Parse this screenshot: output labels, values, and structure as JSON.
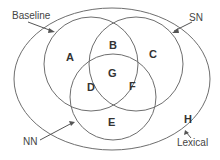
{
  "diagram": {
    "type": "venn",
    "colors": {
      "stroke": "#6e6e6e",
      "text": "#333333",
      "background": "#ffffff"
    },
    "sets": [
      {
        "id": "baseline",
        "label": "Baseline"
      },
      {
        "id": "sn",
        "label": "SN"
      },
      {
        "id": "nn",
        "label": "NN"
      },
      {
        "id": "lexical",
        "label": "Lexical"
      }
    ],
    "regions": [
      {
        "id": "A",
        "label": "A"
      },
      {
        "id": "B",
        "label": "B"
      },
      {
        "id": "C",
        "label": "C"
      },
      {
        "id": "D",
        "label": "D"
      },
      {
        "id": "E",
        "label": "E"
      },
      {
        "id": "F",
        "label": "F"
      },
      {
        "id": "G",
        "label": "G"
      },
      {
        "id": "H",
        "label": "H"
      }
    ]
  }
}
